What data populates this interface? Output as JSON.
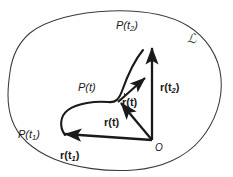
{
  "figure": {
    "background_color": "#ffffff",
    "ink_color": "#1a1a1a",
    "domain_label_color": "#4a4a4a",
    "width": 233,
    "height": 177
  },
  "labels": {
    "point_t2": "P(t",
    "point_t2_sub": "2",
    "point_t2_close": ")",
    "point_t": "P(t)",
    "point_t1": "P(t",
    "point_t1_sub": "1",
    "point_t1_close": ")",
    "vector_r_t2": "r(t",
    "vector_r_t2_sub": "2",
    "vector_r_t2_close": ")",
    "vector_r_t": "r(t)",
    "vector_r_t1": "r(t",
    "vector_r_t1_sub": "1",
    "vector_r_t1_close": ")",
    "vector_rdot_t": "r(t)",
    "origin": "O",
    "domain": "ℒ"
  },
  "geometry": {
    "origin_point": {
      "x": 152,
      "y": 140
    },
    "point_t2_tip": {
      "x": 152,
      "y": 46
    },
    "point_t_tip": {
      "x": 118,
      "y": 102
    },
    "point_t1_tip": {
      "x": 62,
      "y": 134
    },
    "tangent_tip": {
      "x": 146,
      "y": 77
    },
    "boundary_extent": {
      "left": 10,
      "right": 222,
      "top": 10,
      "bottom": 168
    }
  }
}
